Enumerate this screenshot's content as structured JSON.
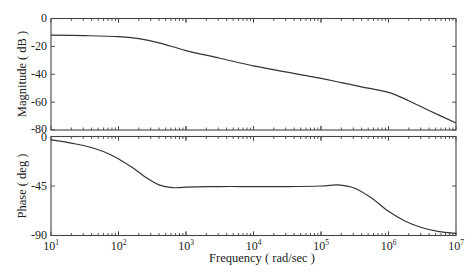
{
  "chart_data": [
    {
      "type": "line",
      "title": "",
      "panel": "magnitude",
      "xlabel": "Frequency (rad/sec)",
      "ylabel": "Magnitude (dB)",
      "xscale": "log",
      "xlim": [
        10,
        10000000
      ],
      "ylim": [
        -80,
        0
      ],
      "yticks": [
        0,
        -20,
        -40,
        -60,
        -80
      ],
      "ytick_labels": [
        "0",
        "-20",
        "-40",
        "-60",
        "-80"
      ],
      "grid": false,
      "series": [
        {
          "name": "Magnitude",
          "log10_x": [
            1,
            1.5,
            2,
            2.3,
            2.6,
            3,
            3.5,
            4,
            4.5,
            5,
            5.3,
            5.6,
            6,
            6.3,
            6.6,
            7
          ],
          "values": [
            -12,
            -12.3,
            -13,
            -14.5,
            -17.5,
            -23,
            -28.5,
            -34,
            -38.5,
            -43,
            -46,
            -49,
            -53,
            -59,
            -66,
            -75
          ]
        }
      ]
    },
    {
      "type": "line",
      "title": "",
      "panel": "phase",
      "xlabel": "Frequency (rad/sec)",
      "ylabel": "Phase (deg)",
      "xscale": "log",
      "xlim": [
        10,
        10000000
      ],
      "ylim": [
        -90,
        0
      ],
      "xticks": [
        10,
        100,
        1000,
        10000,
        100000,
        1000000,
        10000000
      ],
      "xtick_labels": [
        "10^1",
        "10^2",
        "10^3",
        "10^4",
        "10^5",
        "10^6",
        "10^7"
      ],
      "yticks": [
        0,
        -45,
        -90
      ],
      "ytick_labels": [
        "0",
        "-45",
        "-90"
      ],
      "grid": false,
      "series": [
        {
          "name": "Phase",
          "log10_x": [
            1,
            1.3,
            1.6,
            1.9,
            2.2,
            2.4,
            2.6,
            2.8,
            3,
            3.5,
            4,
            4.5,
            5,
            5.25,
            5.5,
            5.75,
            6,
            6.25,
            6.5,
            6.75,
            7
          ],
          "values": [
            -3,
            -6,
            -10,
            -17,
            -28,
            -37,
            -44,
            -46.5,
            -46,
            -45.5,
            -45.5,
            -45.5,
            -45,
            -44,
            -47,
            -56,
            -68,
            -77,
            -83,
            -86.5,
            -88
          ]
        }
      ]
    }
  ],
  "labels": {
    "magnitude_ylabel": "Magnitude ( dB )",
    "phase_ylabel": "Phase ( deg )",
    "xlabel": "Frequency ( rad/sec )",
    "mag_ticks": [
      "0",
      "-20",
      "-40",
      "-60",
      "-80"
    ],
    "phase_ticks": [
      "0",
      "-45",
      "-90"
    ],
    "x_ticks_base": [
      "10",
      "10",
      "10",
      "10",
      "10",
      "10",
      "10"
    ],
    "x_ticks_exp": [
      "1",
      "2",
      "3",
      "4",
      "5",
      "6",
      "7"
    ]
  }
}
